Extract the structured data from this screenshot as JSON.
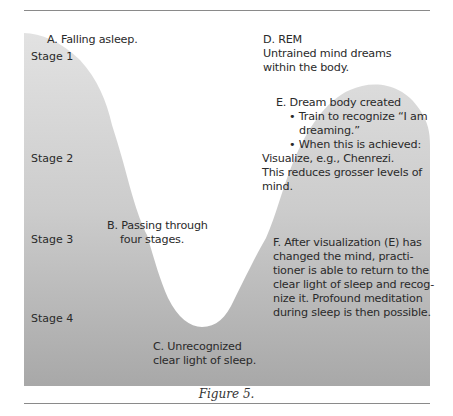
{
  "diagram": {
    "stage_labels": [
      "Stage 1",
      "Stage 2",
      "Stage 3",
      "Stage 4"
    ],
    "labels": {
      "a": "A. Falling asleep.",
      "b_line1": "B. Passing through",
      "b_line2": "four stages.",
      "c_line1": "C. Unrecognized",
      "c_line2": "clear light of sleep.",
      "d_line1": "D. REM",
      "d_line2": "Untrained mind dreams",
      "d_line3": "within the body.",
      "e_title": "E. Dream body created",
      "e_bullet1_line1": "• Train to recognize “I am",
      "e_bullet1_line2": "dreaming.”",
      "e_bullet2": "• When this is achieved:",
      "e_line3": "Visualize, e.g., Chenrezi.",
      "e_line4": "This reduces grosser levels of",
      "e_line5": "mind.",
      "f_line1": "F. After visualization (E) has",
      "f_line2": "changed the mind, practi-",
      "f_line3": "tioner is able to return to the",
      "f_line4": "clear light of sleep and recog-",
      "f_line5": "nize it. Profound meditation",
      "f_line6": "during sleep is then possible."
    },
    "caption": "Figure 5.",
    "colors": {
      "fill_top": "#e0e0e0",
      "fill_bottom": "#a9a9a9",
      "rule": "#8a8a8a",
      "text": "#2a2a2a"
    }
  }
}
